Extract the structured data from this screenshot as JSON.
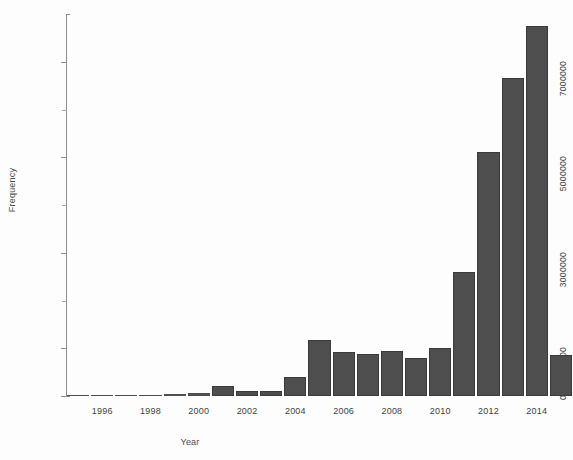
{
  "chart_data": {
    "type": "bar",
    "title": "",
    "xlabel": "Year",
    "ylabel": "Frequency",
    "ylim": [
      0,
      8000000
    ],
    "xlim": [
      1994.5,
      2015.5
    ],
    "grid": false,
    "legend": null,
    "bar_color": "#4e4e4e",
    "axis_color": "#8d8d8d",
    "y_tick_labels": [
      "0",
      "1000000",
      "3000000",
      "5000000",
      "7000000"
    ],
    "y_tick_values": [
      0,
      1000000,
      3000000,
      5000000,
      7000000
    ],
    "y_minor_tick_values": [
      2000000,
      4000000,
      6000000
    ],
    "x_tick_labels": [
      "1996",
      "1998",
      "2000",
      "2002",
      "2004",
      "2006",
      "2008",
      "2010",
      "2012",
      "2014"
    ],
    "x_tick_values": [
      1996,
      1998,
      2000,
      2002,
      2004,
      2006,
      2008,
      2010,
      2012,
      2014
    ],
    "categories": [
      1995,
      1996,
      1997,
      1998,
      1999,
      2000,
      2001,
      2002,
      2003,
      2004,
      2005,
      2006,
      2007,
      2008,
      2009,
      2010,
      2011,
      2012,
      2013,
      2014,
      2015
    ],
    "values": [
      10000,
      15000,
      20000,
      25000,
      40000,
      60000,
      210000,
      110000,
      100000,
      400000,
      1170000,
      930000,
      880000,
      950000,
      800000,
      1000000,
      2600000,
      5100000,
      6650000,
      7750000,
      850000
    ]
  },
  "axes": {
    "ylabel": "Frequency",
    "xlabel": "Year"
  }
}
